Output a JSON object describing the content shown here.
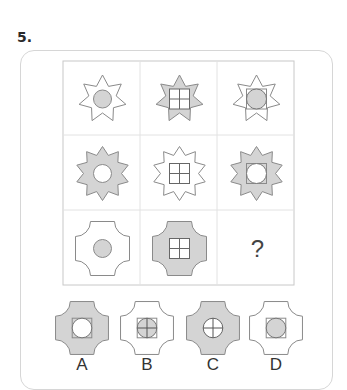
{
  "question": {
    "number": "5."
  },
  "colors": {
    "fill_gray": "#d4d4d4",
    "fill_white": "#ffffff",
    "stroke": "#8a8a8a",
    "grid": "#c8c8c8",
    "text": "#333333"
  },
  "matrix": {
    "rows": [
      [
        {
          "outer": "star7",
          "outer_fill": "white",
          "inner": "circle",
          "inner_fill": "gray"
        },
        {
          "outer": "star7",
          "outer_fill": "gray",
          "inner": "square-cross",
          "inner_fill": "white"
        },
        {
          "outer": "star7",
          "outer_fill": "white",
          "inner": "square-circle",
          "inner_fill": "gray"
        }
      ],
      [
        {
          "outer": "star10",
          "outer_fill": "gray",
          "inner": "circle",
          "inner_fill": "white"
        },
        {
          "outer": "star10",
          "outer_fill": "white",
          "inner": "square-cross",
          "inner_fill": "white"
        },
        {
          "outer": "star10",
          "outer_fill": "gray",
          "inner": "square-circle",
          "inner_fill": "white"
        }
      ],
      [
        {
          "outer": "cross4",
          "outer_fill": "white",
          "inner": "circle",
          "inner_fill": "gray"
        },
        {
          "outer": "cross4",
          "outer_fill": "gray",
          "inner": "square-cross",
          "inner_fill": "white"
        },
        {
          "outer": "missing",
          "label": "?"
        }
      ]
    ]
  },
  "options": [
    {
      "label": "A",
      "outer": "cross4",
      "outer_fill": "gray",
      "inner": "square-circle",
      "inner_fill": "white"
    },
    {
      "label": "B",
      "outer": "cross4",
      "outer_fill": "white",
      "inner": "square-circle-cross",
      "inner_fill": "gray"
    },
    {
      "label": "C",
      "outer": "cross4",
      "outer_fill": "gray",
      "inner": "circle-cross",
      "inner_fill": "white"
    },
    {
      "label": "D",
      "outer": "cross4",
      "outer_fill": "white",
      "inner": "square-circle",
      "inner_fill": "gray"
    }
  ]
}
